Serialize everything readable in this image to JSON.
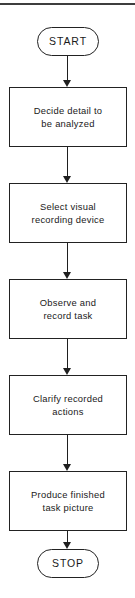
{
  "diagram": {
    "type": "flowchart",
    "orientation": "vertical",
    "title": "",
    "header_rule": "horizontal-rule",
    "nodes": [
      {
        "id": "start",
        "shape": "terminator",
        "label": "START"
      },
      {
        "id": "step1",
        "shape": "process",
        "label": "Decide detail to\nbe analyzed"
      },
      {
        "id": "step2",
        "shape": "process",
        "label": "Select visual\nrecording device"
      },
      {
        "id": "step3",
        "shape": "process",
        "label": "Observe and\nrecord task"
      },
      {
        "id": "step4",
        "shape": "process",
        "label": "Clarify recorded\nactions"
      },
      {
        "id": "step5",
        "shape": "process",
        "label": "Produce finished\ntask picture"
      },
      {
        "id": "stop",
        "shape": "terminator",
        "label": "STOP"
      }
    ],
    "edges": [
      {
        "from": "start",
        "to": "step1",
        "marker": "arrow-down"
      },
      {
        "from": "step1",
        "to": "step2",
        "marker": "arrow-down"
      },
      {
        "from": "step2",
        "to": "step3",
        "marker": "arrow-down"
      },
      {
        "from": "step3",
        "to": "step4",
        "marker": "arrow-down"
      },
      {
        "from": "step4",
        "to": "step5",
        "marker": "arrow-down"
      },
      {
        "from": "step5",
        "to": "stop",
        "marker": "arrow-down"
      }
    ],
    "colors": {
      "stroke": "#222222",
      "rule": "#3d3d3d",
      "text": "#1a1a1a",
      "fill": "#ffffff"
    }
  }
}
